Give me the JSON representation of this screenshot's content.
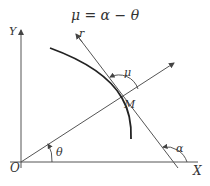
{
  "title": "μ = α − θ",
  "labels": {
    "origin": "O",
    "x_axis": "X",
    "y_axis": "Y",
    "radius": "r",
    "point": "M",
    "theta": "θ",
    "alpha": "α",
    "mu": "μ"
  },
  "colors": {
    "line": "#555555",
    "curve": "#222222",
    "text": "#333333"
  }
}
